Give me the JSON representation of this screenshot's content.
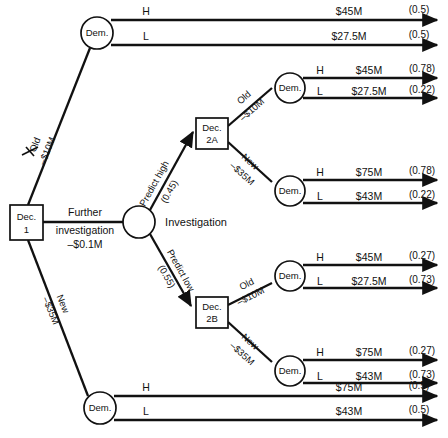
{
  "diagram": {
    "type": "decision-tree",
    "stroke_color": "#111111",
    "background_color": "#ffffff"
  },
  "nodes": {
    "dec1": {
      "label_line1": "Dec.",
      "label_line2": "1",
      "kind": "decision"
    },
    "dec2a": {
      "label_line1": "Dec.",
      "label_line2": "2A",
      "kind": "decision"
    },
    "dec2b": {
      "label_line1": "Dec.",
      "label_line2": "2B",
      "kind": "decision"
    },
    "investigation": {
      "label": "Investigation",
      "kind": "chance"
    },
    "dem_top": {
      "label": "Dem.",
      "kind": "chance"
    },
    "dem_2a_old": {
      "label": "Dem.",
      "kind": "chance"
    },
    "dem_2a_new": {
      "label": "Dem.",
      "kind": "chance"
    },
    "dem_2b_old": {
      "label": "Dem.",
      "kind": "chance"
    },
    "dem_2b_new": {
      "label": "Dem.",
      "kind": "chance"
    },
    "dem_bottom": {
      "label": "Dem.",
      "kind": "chance"
    }
  },
  "branches": {
    "root_old": {
      "line1": "Old",
      "line2": "–$10M",
      "pruned": true
    },
    "root_investigate": {
      "line1": "Further",
      "line2": "investigation",
      "line3": "–$0.1M",
      "pruned": false
    },
    "root_new": {
      "line1": "New",
      "line2": "–$35M",
      "pruned": false
    },
    "predict_high": {
      "line1": "Predict high",
      "line2": "(0.45)"
    },
    "predict_low": {
      "line1": "Predict low",
      "line2": "(0.55)"
    },
    "dec2a_old": {
      "line1": "Old",
      "line2": "–$10M"
    },
    "dec2a_new": {
      "line1": "New",
      "line2": "–$35M"
    },
    "dec2b_old": {
      "line1": "Old",
      "line2": "–$10M"
    },
    "dec2b_new": {
      "line1": "New",
      "line2": "–$35M"
    }
  },
  "outcomes": [
    {
      "group": "dem-top",
      "state": "H",
      "payoff": "$45M",
      "prob": "(0.5)"
    },
    {
      "group": "dem-top",
      "state": "L",
      "payoff": "$27.5M",
      "prob": "(0.5)"
    },
    {
      "group": "dem-2a-old",
      "state": "H",
      "payoff": "$45M",
      "prob": "(0.78)"
    },
    {
      "group": "dem-2a-old",
      "state": "L",
      "payoff": "$27.5M",
      "prob": "(0.22)"
    },
    {
      "group": "dem-2a-new",
      "state": "H",
      "payoff": "$75M",
      "prob": "(0.78)"
    },
    {
      "group": "dem-2a-new",
      "state": "L",
      "payoff": "$43M",
      "prob": "(0.22)"
    },
    {
      "group": "dem-2b-old",
      "state": "H",
      "payoff": "$45M",
      "prob": "(0.27)"
    },
    {
      "group": "dem-2b-old",
      "state": "L",
      "payoff": "$27.5M",
      "prob": "(0.73)"
    },
    {
      "group": "dem-2b-new",
      "state": "H",
      "payoff": "$75M",
      "prob": "(0.27)"
    },
    {
      "group": "dem-2b-new",
      "state": "L",
      "payoff": "$43M",
      "prob": "(0.73)"
    },
    {
      "group": "dem-bottom",
      "state": "H",
      "payoff": "$75M",
      "prob": "(0.5)"
    },
    {
      "group": "dem-bottom",
      "state": "L",
      "payoff": "$43M",
      "prob": "(0.5)"
    }
  ]
}
